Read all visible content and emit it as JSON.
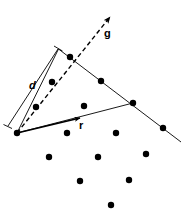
{
  "figure": {
    "width": 193,
    "height": 220,
    "background_color": "#ffffff",
    "stroke_color": "#000000",
    "dot_color": "#000000"
  },
  "labels": {
    "d": {
      "text": "d",
      "x": 29,
      "y": 80
    },
    "g": {
      "text": "g",
      "x": 104,
      "y": 28
    },
    "r": {
      "text": "r",
      "x": 79,
      "y": 120
    }
  },
  "chart_data": {
    "type": "scatter",
    "title": "",
    "xlabel": "",
    "ylabel": "",
    "xlim": [
      0,
      193
    ],
    "ylim": [
      0,
      220
    ],
    "grid": false,
    "legend": "none",
    "dot_radius": 3.2,
    "points": [
      {
        "x": 17,
        "y": 133,
        "name": "origin"
      },
      {
        "x": 52,
        "y": 82,
        "name": "lattice-point"
      },
      {
        "x": 70,
        "y": 57,
        "name": "lattice-point"
      },
      {
        "x": 101,
        "y": 81,
        "name": "lattice-point"
      },
      {
        "x": 36,
        "y": 107,
        "name": "lattice-point"
      },
      {
        "x": 84,
        "y": 106,
        "name": "lattice-point"
      },
      {
        "x": 133,
        "y": 103,
        "name": "lattice-point"
      },
      {
        "x": 67,
        "y": 133,
        "name": "lattice-point"
      },
      {
        "x": 116,
        "y": 133,
        "name": "lattice-point"
      },
      {
        "x": 163,
        "y": 128,
        "name": "lattice-point"
      },
      {
        "x": 49,
        "y": 157,
        "name": "lattice-point"
      },
      {
        "x": 98,
        "y": 157,
        "name": "lattice-point"
      },
      {
        "x": 146,
        "y": 154,
        "name": "lattice-point"
      },
      {
        "x": 80,
        "y": 181,
        "name": "lattice-point"
      },
      {
        "x": 129,
        "y": 180,
        "name": "lattice-point"
      },
      {
        "x": 111,
        "y": 205,
        "name": "lattice-point"
      }
    ],
    "annotations": [
      {
        "label": "d",
        "kind": "dimension-line",
        "from": [
          8,
          126
        ],
        "to": [
          58,
          49
        ]
      },
      {
        "label": "g",
        "kind": "dashed-arrow",
        "from": [
          17,
          133
        ],
        "to": [
          112,
          15
        ]
      },
      {
        "label": "r",
        "kind": "solid-arrow",
        "from": [
          17,
          133
        ],
        "to": [
          84,
          117
        ]
      },
      {
        "label": "",
        "kind": "cone-edge-upper",
        "from": [
          17,
          133
        ],
        "to": [
          58,
          49
        ]
      },
      {
        "label": "",
        "kind": "cone-edge-lower",
        "from": [
          17,
          133
        ],
        "to": [
          133,
          103
        ]
      },
      {
        "label": "",
        "kind": "boundary-line",
        "from": [
          58,
          49
        ],
        "to": [
          181,
          142
        ]
      }
    ]
  }
}
